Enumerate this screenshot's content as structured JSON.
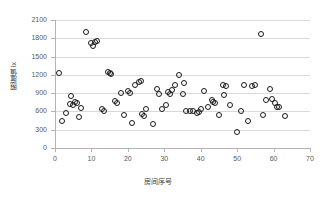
{
  "chart_data": {
    "type": "scatter",
    "title": "",
    "xlabel": "房间序号",
    "ylabel": "照度值 lx",
    "xlim": [
      0,
      70
    ],
    "ylim": [
      0,
      2100
    ],
    "xticks": [
      0,
      10,
      20,
      30,
      40,
      50,
      60,
      70
    ],
    "yticks": [
      0,
      300,
      600,
      900,
      1200,
      1500,
      1800,
      2100
    ],
    "grid": "horizontal",
    "legend": "none",
    "marker": {
      "shape": "circle-open",
      "edge_color": "#1a1a1a",
      "fill": "none",
      "size_px": 6
    },
    "series": [
      {
        "name": "照度值",
        "points": [
          [
            1,
            1230
          ],
          [
            2,
            450
          ],
          [
            3,
            570
          ],
          [
            4,
            720
          ],
          [
            4.5,
            860
          ],
          [
            5,
            700
          ],
          [
            5.5,
            760
          ],
          [
            6,
            735
          ],
          [
            6.5,
            515
          ],
          [
            7,
            650
          ],
          [
            8.5,
            1910
          ],
          [
            10,
            1730
          ],
          [
            10.5,
            1680
          ],
          [
            11,
            1745
          ],
          [
            11.5,
            1760
          ],
          [
            13,
            645
          ],
          [
            13.5,
            600
          ],
          [
            14.5,
            1255
          ],
          [
            15,
            1235
          ],
          [
            15.5,
            1215
          ],
          [
            16.5,
            775
          ],
          [
            17,
            745
          ],
          [
            18,
            895
          ],
          [
            19,
            545
          ],
          [
            20,
            935
          ],
          [
            20.5,
            900
          ],
          [
            21,
            410
          ],
          [
            22,
            1040
          ],
          [
            23,
            1090
          ],
          [
            23.5,
            1105
          ],
          [
            24,
            555
          ],
          [
            24.5,
            525
          ],
          [
            25,
            645
          ],
          [
            27,
            390
          ],
          [
            28,
            965
          ],
          [
            28.5,
            885
          ],
          [
            29.5,
            645
          ],
          [
            30.5,
            700
          ],
          [
            31,
            925
          ],
          [
            31.5,
            885
          ],
          [
            32,
            955
          ],
          [
            33,
            1030
          ],
          [
            34,
            1200
          ],
          [
            35,
            880
          ],
          [
            35.5,
            1065
          ],
          [
            36,
            610
          ],
          [
            37,
            600
          ],
          [
            38,
            610
          ],
          [
            39,
            575
          ],
          [
            39.5,
            590
          ],
          [
            40,
            640
          ],
          [
            41,
            940
          ],
          [
            42,
            670
          ],
          [
            43,
            790
          ],
          [
            43.5,
            750
          ],
          [
            44,
            745
          ],
          [
            45,
            540
          ],
          [
            46,
            1040
          ],
          [
            46.5,
            875
          ],
          [
            47,
            1015
          ],
          [
            48,
            700
          ],
          [
            50,
            260
          ],
          [
            51,
            615
          ],
          [
            52,
            1040
          ],
          [
            53,
            440
          ],
          [
            54,
            1020
          ],
          [
            55,
            1030
          ],
          [
            56.5,
            1865
          ],
          [
            57,
            540
          ],
          [
            58,
            790
          ],
          [
            59,
            975
          ],
          [
            59.5,
            800
          ],
          [
            60.5,
            740
          ],
          [
            61,
            680
          ],
          [
            61.5,
            675
          ],
          [
            63,
            530
          ]
        ]
      }
    ]
  }
}
